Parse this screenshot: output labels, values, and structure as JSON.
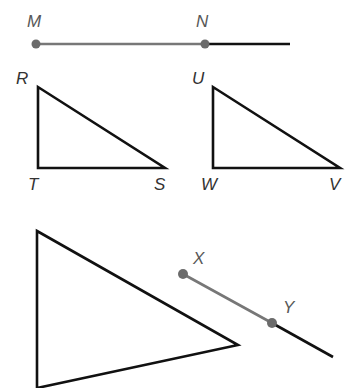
{
  "figure": {
    "background_color": "#ffffff",
    "width": 361,
    "height": 388,
    "colors": {
      "segment_gray": "#777777",
      "segment_black": "#111111",
      "dot_gray": "#6b6b6b",
      "label_gray": "#585858",
      "label_dark": "#333333",
      "outline": "#111111"
    }
  },
  "ray_mn": {
    "name": "ray-MN",
    "points": [
      {
        "label": "M",
        "x": 36,
        "y": 44,
        "label_x": 27,
        "label_y": 27
      },
      {
        "label": "N",
        "x": 205,
        "y": 44,
        "label_x": 196,
        "label_y": 27
      }
    ],
    "segment_gray": {
      "x1": 36,
      "y1": 44,
      "x2": 205,
      "y2": 44
    },
    "segment_black": {
      "x1": 205,
      "y1": 44,
      "x2": 290,
      "y2": 44
    },
    "arrow_tip": {
      "x": 302,
      "y": 44
    },
    "dot_radius": 4.5
  },
  "triangle_rts": {
    "name": "triangle-RTS",
    "vertices": [
      {
        "label": "R",
        "x": 38,
        "y": 87,
        "label_x": 16,
        "label_y": 84
      },
      {
        "label": "T",
        "x": 38,
        "y": 168,
        "label_x": 28,
        "label_y": 190
      },
      {
        "label": "S",
        "x": 165,
        "y": 168,
        "label_x": 154,
        "label_y": 190
      }
    ],
    "path": "M 38 87 L 38 168 L 165 168 Z"
  },
  "triangle_uwv": {
    "name": "triangle-UWV",
    "vertices": [
      {
        "label": "U",
        "x": 213,
        "y": 87,
        "label_x": 192,
        "label_y": 84
      },
      {
        "label": "W",
        "x": 213,
        "y": 168,
        "label_x": 201,
        "label_y": 190
      },
      {
        "label": "V",
        "x": 340,
        "y": 168,
        "label_x": 329,
        "label_y": 190
      }
    ],
    "path": "M 213 87 L 213 168 L 340 168 Z"
  },
  "triangle_large": {
    "name": "triangle-large-cropped",
    "description": "Large leftward-pointing triangle, bottom vertex cropped by image edge",
    "path": "M 37 231 L 238 345 L 37 388 Z",
    "apex_top": {
      "x": 37,
      "y": 231
    },
    "apex_right": {
      "x": 238,
      "y": 345
    },
    "bottom_cropped": true
  },
  "ray_xy": {
    "name": "ray-XY",
    "points": [
      {
        "label": "X",
        "x": 183,
        "y": 274,
        "label_x": 193,
        "label_y": 264
      },
      {
        "label": "Y",
        "x": 272,
        "y": 323,
        "label_x": 283,
        "label_y": 313
      }
    ],
    "segment_gray": {
      "x1": 183,
      "y1": 274,
      "x2": 272,
      "y2": 323
    },
    "segment_black": {
      "x1": 272,
      "y1": 323,
      "x2": 333,
      "y2": 357
    },
    "arrow_tip": {
      "x": 347,
      "y": 365
    },
    "dot_radius": 5
  }
}
